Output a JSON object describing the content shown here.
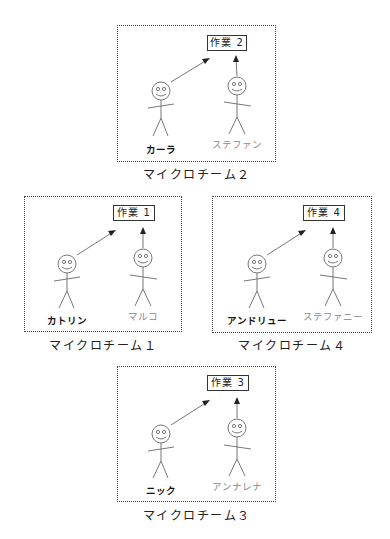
{
  "diagram": {
    "teams": [
      {
        "id": "team2",
        "label": "マイクロチーム２",
        "task": "作業 2",
        "lead": "カーラ",
        "member": "ステファン"
      },
      {
        "id": "team1",
        "label": "マイクロチーム１",
        "task": "作業 1",
        "lead": "カトリン",
        "member": "マルコ"
      },
      {
        "id": "team4",
        "label": "マイクロチーム４",
        "task": "作業 4",
        "lead": "アンドリュー",
        "member": "ステファニー"
      },
      {
        "id": "team3",
        "label": "マイクロチーム３",
        "task": "作業 3",
        "lead": "ニック",
        "member": "アンナレナ"
      }
    ],
    "colors": {
      "border": "#444444",
      "lead_text": "#111111",
      "member_text": "#888888",
      "stroke": "#777777"
    }
  }
}
